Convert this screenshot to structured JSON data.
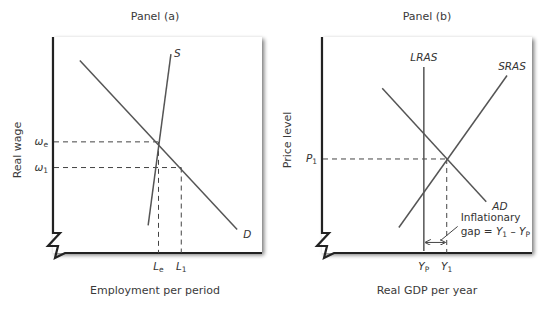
{
  "chart_data": [
    {
      "type": "line",
      "panel_title": "Panel (a)",
      "xlabel": "Employment per period",
      "ylabel": "Real wage",
      "grid": false,
      "xlim": [
        0,
        100
      ],
      "ylim": [
        0,
        100
      ],
      "series": [
        {
          "name": "D",
          "label": "D",
          "points": [
            [
              12,
              89
            ],
            [
              88,
              10
            ]
          ]
        },
        {
          "name": "S",
          "label": "S",
          "points": [
            [
              56,
              92
            ],
            [
              45,
              12
            ]
          ]
        }
      ],
      "reference_lines": [
        {
          "name": "w_e",
          "axis": "y",
          "value": 51,
          "x_end": 50,
          "label": "ω",
          "sub": "e"
        },
        {
          "name": "w_1",
          "axis": "y",
          "value": 39,
          "x_end": 61,
          "label": "ω",
          "sub": "1"
        },
        {
          "name": "L_e",
          "axis": "x",
          "value": 50,
          "y_end": 51,
          "label": "L",
          "sub": "e"
        },
        {
          "name": "L_1",
          "axis": "x",
          "value": 61,
          "y_end": 39,
          "label": "L",
          "sub": "1"
        }
      ]
    },
    {
      "type": "line",
      "panel_title": "Panel (b)",
      "xlabel": "Real GDP per year",
      "ylabel": "Price level",
      "grid": false,
      "xlim": [
        0,
        100
      ],
      "ylim": [
        0,
        100
      ],
      "series": [
        {
          "name": "LRAS",
          "label": "LRAS",
          "points": [
            [
              48,
              86
            ],
            [
              48,
              0
            ]
          ]
        },
        {
          "name": "SRAS",
          "label": "SRAS",
          "points": [
            [
              36,
              11
            ],
            [
              88,
              82
            ]
          ]
        },
        {
          "name": "AD",
          "label": "AD",
          "points": [
            [
              28,
              76
            ],
            [
              78,
              23
            ]
          ]
        }
      ],
      "reference_lines": [
        {
          "name": "P_1",
          "axis": "y",
          "value": 43,
          "x_end": 59,
          "label": "P",
          "sub": "1"
        },
        {
          "name": "Y_1",
          "axis": "x",
          "value": 59,
          "y_end": 43,
          "label": "Y",
          "sub": "1"
        },
        {
          "name": "Y_P",
          "axis": "x",
          "value": 48,
          "y_end": null,
          "label": "Y",
          "sub": "P"
        }
      ],
      "annotations": [
        {
          "text_line1": "Inflationary",
          "text_line2_prefix": "gap = ",
          "text_line2_Y1": "Y",
          "text_line2_Y1_sub": "1",
          "text_line2_minus": " – ",
          "text_line2_YP": "Y",
          "text_line2_YP_sub": "P",
          "x_range": [
            48,
            58
          ],
          "y": 4
        }
      ]
    }
  ]
}
